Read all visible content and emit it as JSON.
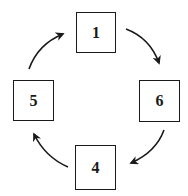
{
  "diagram": {
    "type": "cycle",
    "colors": {
      "stroke": "#1a1a1a",
      "background": "#ffffff"
    },
    "nodes": [
      {
        "id": "n1",
        "label": "1",
        "position": "top"
      },
      {
        "id": "n6",
        "label": "6",
        "position": "right"
      },
      {
        "id": "n4",
        "label": "4",
        "position": "bottom"
      },
      {
        "id": "n5",
        "label": "5",
        "position": "left"
      }
    ],
    "edges": [
      {
        "from": "1",
        "to": "6",
        "direction": "clockwise"
      },
      {
        "from": "6",
        "to": "4",
        "direction": "clockwise"
      },
      {
        "from": "4",
        "to": "5",
        "direction": "clockwise"
      },
      {
        "from": "5",
        "to": "1",
        "direction": "clockwise"
      }
    ]
  }
}
